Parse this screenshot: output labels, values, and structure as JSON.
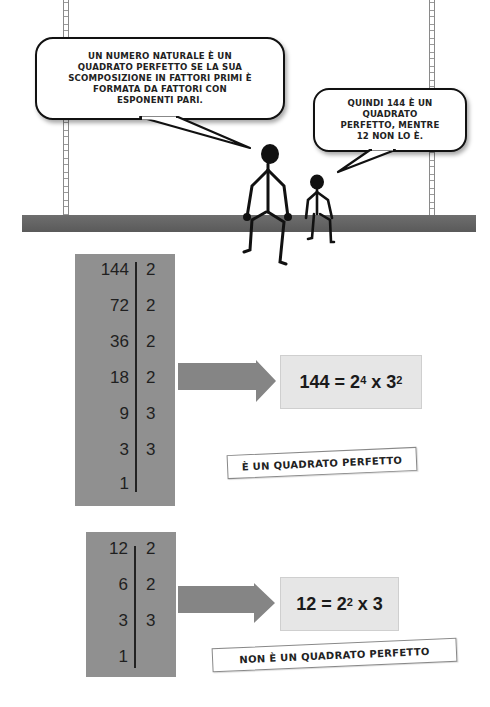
{
  "comic": {
    "bubble_adult": {
      "lines": [
        "UN NUMERO NATURALE È UN",
        "QUADRATO PERFETTO SE LA SUA",
        "SCOMPOSIZIONE IN FATTORI PRIMI È",
        "FORMATA DA FATTORI CON",
        "ESPONENTI PARI."
      ]
    },
    "bubble_child": {
      "lines": [
        "QUINDI 144 È UN",
        "QUADRATO",
        "PERFETTO, MENTRE",
        "12 NON LO È."
      ]
    }
  },
  "example_144": {
    "rows": [
      {
        "number": "144",
        "factor": "2"
      },
      {
        "number": "72",
        "factor": "2"
      },
      {
        "number": "36",
        "factor": "2"
      },
      {
        "number": "18",
        "factor": "2"
      },
      {
        "number": "9",
        "factor": "3"
      },
      {
        "number": "3",
        "factor": "3"
      },
      {
        "number": "1",
        "factor": ""
      }
    ],
    "result": {
      "base_text": "144 = 2",
      "exp1": "4",
      "mid_text": " x 3",
      "exp2": "2",
      "tail_text": ""
    },
    "caption": "È UN QUADRATO PERFETTO"
  },
  "example_12": {
    "rows": [
      {
        "number": "12",
        "factor": "2"
      },
      {
        "number": "6",
        "factor": "2"
      },
      {
        "number": "3",
        "factor": "3"
      },
      {
        "number": "1",
        "factor": ""
      }
    ],
    "result": {
      "base_text": "12 = 2",
      "exp1": "2",
      "mid_text": " x 3",
      "exp2": "",
      "tail_text": ""
    },
    "caption": "NON È UN QUADRATO PERFETTO"
  },
  "colors": {
    "table_bg": "#909090",
    "arrow": "#858585",
    "result_bg": "#e6e6e6",
    "seat": "#636363"
  }
}
